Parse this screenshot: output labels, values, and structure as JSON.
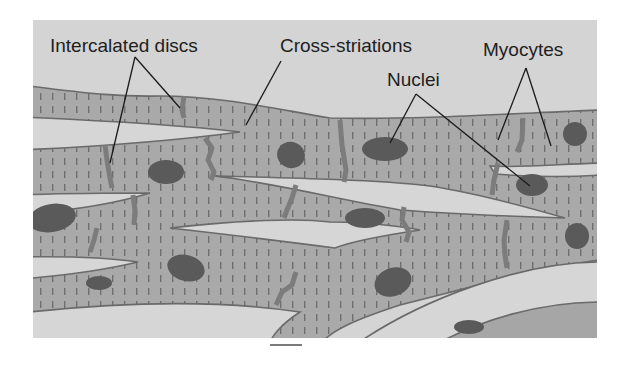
{
  "figure": {
    "labels": [
      {
        "id": "intercalated-discs",
        "text": "Intercalated discs"
      },
      {
        "id": "cross-striations",
        "text": "Cross-striations"
      },
      {
        "id": "nuclei",
        "text": "Nuclei"
      },
      {
        "id": "myocytes",
        "text": "Myocytes"
      }
    ],
    "colors": {
      "background_panel": "#d4d4d4",
      "myocyte_fill": "#a9a9a9",
      "striation_mark": "#6f6f6f",
      "nucleus": "#5a5a5a",
      "intercalated_disc": "#7c7c7c",
      "cell_outline": "#6a6a6a",
      "label_text": "#1e1e1e"
    },
    "scale_bar": {
      "present": true
    }
  }
}
